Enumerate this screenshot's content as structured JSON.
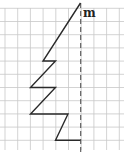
{
  "figure": {
    "axis_label": "m",
    "colors": {
      "grid": "#c8c8c8",
      "polyline": "#2a2a2a",
      "axis_dashed": "#555555",
      "background": "#ffffff"
    },
    "grid": {
      "x_lines": [
        5,
        17.7,
        30.4,
        43.1,
        55.8,
        68.5,
        81.2,
        93.9,
        106.6,
        119.3
      ],
      "y_lines": [
        8.3,
        21.5,
        34.7,
        47.9,
        61.1,
        74.3,
        87.5,
        100.7,
        113.9,
        127.1,
        140.3
      ],
      "x_range": [
        0,
        124
      ],
      "y_range": [
        8,
        150
      ]
    },
    "symmetry_axis": {
      "x": 80.7,
      "y_start": 3,
      "y_end": 152
    },
    "polyline_points": [
      [
        80.5,
        3
      ],
      [
        43,
        61
      ],
      [
        55.5,
        61
      ],
      [
        30.5,
        87.5
      ],
      [
        55.5,
        87.5
      ],
      [
        30.5,
        114
      ],
      [
        68,
        114
      ],
      [
        55.5,
        140.3
      ],
      [
        80.5,
        140.3
      ]
    ]
  }
}
